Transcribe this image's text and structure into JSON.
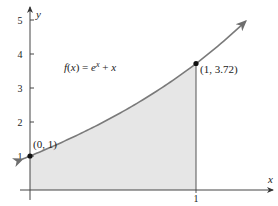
{
  "chart_data": {
    "type": "area",
    "title": "",
    "function_label": "f(x) = e^x + x",
    "function_label_parts": {
      "f": "f",
      "lp": "(",
      "x1": "x",
      "rp": ")",
      "eq": " = ",
      "e": "e",
      "sup": "x",
      "plus": " + ",
      "x2": "x"
    },
    "xlabel": "x",
    "ylabel": "y",
    "x_ticks": [
      {
        "value": 1,
        "label": "1"
      }
    ],
    "y_ticks": [
      {
        "value": 1,
        "label": "1"
      },
      {
        "value": 2,
        "label": "2"
      },
      {
        "value": 3,
        "label": "3"
      },
      {
        "value": 4,
        "label": "4"
      },
      {
        "value": 5,
        "label": "5"
      }
    ],
    "xlim": [
      -0.05,
      1.5
    ],
    "ylim": [
      0,
      5.2
    ],
    "shaded_region": {
      "from": 0,
      "to": 1,
      "color": "#e6e6e6"
    },
    "points": [
      {
        "x": 0,
        "y": 1,
        "label": "(0, 1)"
      },
      {
        "x": 1,
        "y": 3.72,
        "label": "(1, 3.72)"
      }
    ],
    "curve_color": "#7a7a7a",
    "axis_color": "#555555",
    "grid": false
  }
}
